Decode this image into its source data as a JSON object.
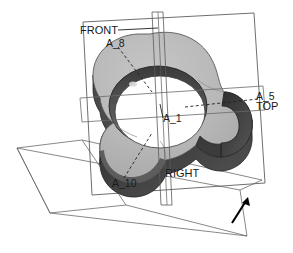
{
  "view": {
    "title": "3D CAD model viewport",
    "background_color": "#ffffff",
    "render_style": "shaded-grayscale"
  },
  "model": {
    "name": "three-lobed cam rotor with central bore",
    "body_fill": "#b9b9b9",
    "body_shade_dark": "#3d3d3d",
    "body_shade_mid": "#8a8a8a",
    "bore_fill": "#ffffff",
    "outline_color": "#2b2b2b"
  },
  "datum_planes": [
    {
      "id": "front",
      "label": "FRONT",
      "orientation": "tilted-frontal-rectangle",
      "line_color": "#555555"
    },
    {
      "id": "top",
      "label": "TOP",
      "orientation": "horizontal-sliver",
      "line_color": "#555555"
    },
    {
      "id": "right",
      "label": "RIGHT",
      "orientation": "vertical-sliver",
      "line_color": "#555555"
    }
  ],
  "axes": [
    {
      "label": "A_1",
      "display": "A_1",
      "kind": "bore-axis",
      "leader": false
    },
    {
      "label": "A_5",
      "display": "A_5",
      "kind": "datum-axis",
      "leader": true
    },
    {
      "label": "A_8",
      "display": "A_8",
      "kind": "datum-axis",
      "leader": true
    },
    {
      "label": "A_10",
      "display": "A_10",
      "kind": "datum-axis",
      "leader": true
    }
  ],
  "annotations": {
    "front_label": "FRONT",
    "top_label": "TOP",
    "right_label": "RIGHT",
    "axis_a1": "A_1",
    "axis_a5": "A_5",
    "axis_a8": "A_8",
    "axis_a10": "A_10"
  },
  "direction_indicator": {
    "name": "plane-normal-arrow",
    "color": "#000000",
    "points": "up-right"
  }
}
